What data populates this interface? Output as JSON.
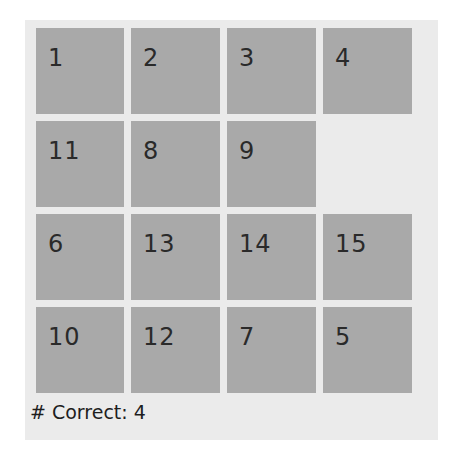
{
  "puzzle": {
    "rows": 4,
    "cols": 4,
    "tiles": [
      [
        "1",
        "2",
        "3",
        "4"
      ],
      [
        "11",
        "8",
        "9",
        ""
      ],
      [
        "6",
        "13",
        "14",
        "15"
      ],
      [
        "10",
        "12",
        "7",
        "5"
      ]
    ],
    "blank_position": {
      "row": 2,
      "col": 4
    }
  },
  "status": {
    "label": "# Correct: 4",
    "correct_count": 4
  },
  "colors": {
    "tile": "#a9a9a9",
    "board_background": "#ebebeb",
    "text": "#2a2a2a"
  }
}
